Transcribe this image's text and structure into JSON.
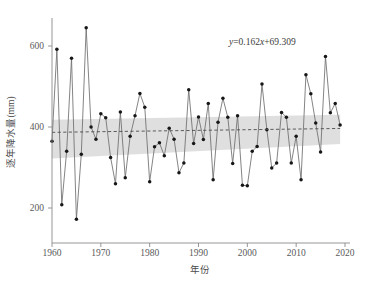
{
  "chart_data": {
    "type": "line",
    "title": "",
    "subtitle": "",
    "xlabel": "年份",
    "ylabel": "逐年降水量(mm)",
    "xlim": [
      1959,
      2021
    ],
    "ylim": [
      140,
      670
    ],
    "xticks": [
      1960,
      1970,
      1980,
      1990,
      2000,
      2010,
      2020
    ],
    "yticks": [
      200,
      400,
      600
    ],
    "xtick_labels": [
      "1960",
      "1970",
      "1980",
      "1990",
      "2000",
      "2010",
      "2020"
    ],
    "ytick_labels": [
      "200",
      "400",
      "600"
    ],
    "grid": false,
    "legend": null,
    "legend_position": "none",
    "annotations": [
      {
        "name": "regression-equation",
        "text": "y=0.162x+69.309",
        "text_parts": [
          "y",
          "=0.162",
          "x",
          "+69.309"
        ],
        "x": 2002,
        "y": 610
      }
    ],
    "series": [
      {
        "name": "逐年降水量",
        "marker": "circle",
        "marker_color": "#171717",
        "line_color": "#6e6e6e",
        "x": [
          1960,
          1961,
          1962,
          1963,
          1964,
          1965,
          1966,
          1967,
          1968,
          1969,
          1970,
          1971,
          1972,
          1973,
          1974,
          1975,
          1976,
          1977,
          1978,
          1979,
          1980,
          1981,
          1982,
          1983,
          1984,
          1985,
          1986,
          1987,
          1988,
          1989,
          1990,
          1991,
          1992,
          1993,
          1994,
          1995,
          1996,
          1997,
          1998,
          1999,
          2000,
          2001,
          2002,
          2003,
          2004,
          2005,
          2006,
          2007,
          2008,
          2009,
          2010,
          2011,
          2012,
          2013,
          2014,
          2015,
          2016,
          2017,
          2018,
          2019
        ],
        "values": [
          365,
          592,
          208,
          340,
          570,
          172,
          333,
          645,
          400,
          370,
          433,
          423,
          325,
          260,
          437,
          275,
          377,
          428,
          483,
          449,
          265,
          351,
          361,
          329,
          397,
          370,
          287,
          311,
          492,
          359,
          425,
          369,
          458,
          270,
          412,
          471,
          424,
          310,
          428,
          256,
          255,
          340,
          352,
          506,
          393,
          299,
          311,
          436,
          424,
          311,
          377,
          270,
          529,
          482,
          410,
          338,
          574,
          435,
          458,
          405
        ]
      }
    ],
    "trend": {
      "name": "linear-trend",
      "type": "linear-regression",
      "equation": "y=0.162x+69.309",
      "slope": 0.162,
      "intercept": 69.309,
      "style": "dashed",
      "color": "#4c4c4c",
      "x_start": 1960,
      "x_end": 2019,
      "y_start": 386.8,
      "y_end": 396.4
    },
    "confidence_band": {
      "name": "confidence-interval-band",
      "color": "#d2d2d2",
      "opacity": 0.72,
      "x_start": 1960,
      "x_end": 2019,
      "upper_start": 418,
      "upper_end": 430,
      "lower_start": 322,
      "lower_end": 358
    }
  },
  "axes": {
    "y_title": "逐年降水量(mm)",
    "x_title": "年份"
  }
}
